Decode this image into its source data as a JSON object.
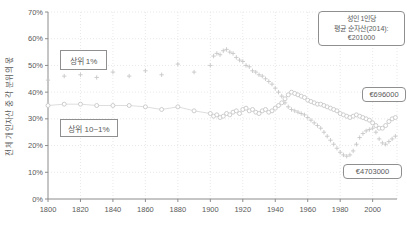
{
  "chart_data": {
    "type": "scatter",
    "title": "",
    "xlabel": "",
    "ylabel": "전체 개인자산 중 각 분위의 몫",
    "xlim": [
      1800,
      2015
    ],
    "ylim": [
      0,
      70
    ],
    "x_ticks": [
      1800,
      1820,
      1840,
      1860,
      1880,
      1900,
      1920,
      1940,
      1960,
      1980,
      2000
    ],
    "y_ticks": [
      0,
      10,
      20,
      30,
      40,
      50,
      60,
      70
    ],
    "y_tick_suffix": "%",
    "grid": true,
    "legend_position": "annotation-boxes-on-plot",
    "series": [
      {
        "name": "상위 1%",
        "marker": "plus",
        "line": false,
        "color": "#c7c7c7",
        "points": [
          [
            1800,
            44.5
          ],
          [
            1810,
            46
          ],
          [
            1820,
            46.5
          ],
          [
            1830,
            45.5
          ],
          [
            1840,
            47.5
          ],
          [
            1850,
            46
          ],
          [
            1860,
            48
          ],
          [
            1870,
            46.5
          ],
          [
            1880,
            50.5
          ],
          [
            1890,
            47.5
          ],
          [
            1900,
            50
          ],
          [
            1902,
            53.5
          ],
          [
            1904,
            54.5
          ],
          [
            1906,
            54
          ],
          [
            1908,
            55.5
          ],
          [
            1910,
            56
          ],
          [
            1912,
            55
          ],
          [
            1914,
            54.5
          ],
          [
            1916,
            53
          ],
          [
            1918,
            52
          ],
          [
            1920,
            51.5
          ],
          [
            1922,
            50
          ],
          [
            1924,
            49.5
          ],
          [
            1926,
            48
          ],
          [
            1928,
            47.5
          ],
          [
            1930,
            46.5
          ],
          [
            1932,
            46
          ],
          [
            1934,
            45
          ],
          [
            1936,
            44
          ],
          [
            1938,
            43
          ],
          [
            1940,
            41.5
          ],
          [
            1942,
            40
          ],
          [
            1944,
            38.5
          ],
          [
            1946,
            36
          ],
          [
            1948,
            34.5
          ],
          [
            1950,
            33.5
          ],
          [
            1952,
            33
          ],
          [
            1954,
            32.5
          ],
          [
            1956,
            32
          ],
          [
            1958,
            31.5
          ],
          [
            1960,
            30.5
          ],
          [
            1962,
            29.5
          ],
          [
            1964,
            28.5
          ],
          [
            1966,
            27.5
          ],
          [
            1968,
            26.5
          ],
          [
            1970,
            25
          ],
          [
            1972,
            23.5
          ],
          [
            1974,
            22
          ],
          [
            1976,
            20.5
          ],
          [
            1978,
            19
          ],
          [
            1980,
            17.5
          ],
          [
            1982,
            16.5
          ],
          [
            1984,
            16
          ],
          [
            1986,
            16.5
          ],
          [
            1988,
            18
          ],
          [
            1990,
            20.5
          ],
          [
            1992,
            23
          ],
          [
            1994,
            24.5
          ],
          [
            1996,
            25.5
          ],
          [
            1998,
            26
          ],
          [
            2000,
            26.5
          ],
          [
            2002,
            25
          ],
          [
            2004,
            22.5
          ],
          [
            2006,
            21
          ],
          [
            2008,
            20.5
          ],
          [
            2010,
            21.5
          ],
          [
            2012,
            22.5
          ],
          [
            2014,
            23.5
          ]
        ]
      },
      {
        "name": "상위 10~1%",
        "marker": "circle",
        "line": true,
        "color": "#c7c7c7",
        "points": [
          [
            1800,
            35
          ],
          [
            1810,
            35.5
          ],
          [
            1820,
            35.5
          ],
          [
            1830,
            35
          ],
          [
            1840,
            35
          ],
          [
            1850,
            35
          ],
          [
            1860,
            34.5
          ],
          [
            1870,
            33.5
          ],
          [
            1880,
            34.5
          ],
          [
            1890,
            33
          ],
          [
            1900,
            32
          ],
          [
            1902,
            31
          ],
          [
            1904,
            31.5
          ],
          [
            1906,
            30.5
          ],
          [
            1908,
            31
          ],
          [
            1910,
            32
          ],
          [
            1912,
            31.5
          ],
          [
            1914,
            32.5
          ],
          [
            1916,
            33
          ],
          [
            1918,
            32
          ],
          [
            1920,
            33.5
          ],
          [
            1922,
            34
          ],
          [
            1924,
            33
          ],
          [
            1926,
            33.5
          ],
          [
            1928,
            32.5
          ],
          [
            1930,
            32
          ],
          [
            1932,
            33
          ],
          [
            1934,
            33.5
          ],
          [
            1936,
            32.5
          ],
          [
            1938,
            33
          ],
          [
            1940,
            34
          ],
          [
            1942,
            35
          ],
          [
            1944,
            36
          ],
          [
            1946,
            37.5
          ],
          [
            1948,
            39
          ],
          [
            1950,
            40
          ],
          [
            1952,
            39.5
          ],
          [
            1954,
            39
          ],
          [
            1956,
            38.5
          ],
          [
            1958,
            38
          ],
          [
            1960,
            37
          ],
          [
            1962,
            36.5
          ],
          [
            1964,
            36
          ],
          [
            1966,
            35.5
          ],
          [
            1968,
            35.5
          ],
          [
            1970,
            35
          ],
          [
            1972,
            34.5
          ],
          [
            1974,
            34
          ],
          [
            1976,
            33.5
          ],
          [
            1978,
            33
          ],
          [
            1980,
            32
          ],
          [
            1982,
            31.5
          ],
          [
            1984,
            31
          ],
          [
            1986,
            30.5
          ],
          [
            1988,
            31
          ],
          [
            1990,
            31.5
          ],
          [
            1992,
            31
          ],
          [
            1994,
            30.5
          ],
          [
            1996,
            30
          ],
          [
            1998,
            29.5
          ],
          [
            2000,
            28.5
          ],
          [
            2002,
            27.5
          ],
          [
            2004,
            26.5
          ],
          [
            2006,
            26.5
          ],
          [
            2008,
            27.5
          ],
          [
            2010,
            29
          ],
          [
            2012,
            30
          ],
          [
            2014,
            30.5
          ]
        ]
      }
    ],
    "annotations": {
      "top1_label": "상위 1%",
      "top10_label": "상위 10~1%",
      "legend_lines": [
        "성인 1인당",
        "평균 순자산(2014):",
        "€201000"
      ],
      "top10_value": "€696000",
      "top1_value": "€4703000"
    }
  },
  "colors": {
    "background": "#ffffff",
    "grid": "#e2e2e2",
    "axis": "#8c8c8c",
    "tick_text": "#595959",
    "series": "#c7c7c7",
    "series_line": "#d4d4d4",
    "annotation_border": "#8f8f8f",
    "annotation_text": "#595959"
  }
}
